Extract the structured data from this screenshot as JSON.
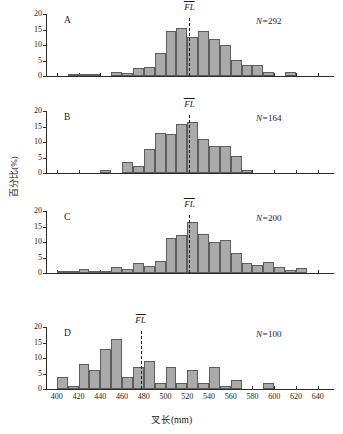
{
  "axes": {
    "ylabel": "百分比(%)",
    "xlabel": "叉长(mm)",
    "yticks": [
      "0",
      "5",
      "10",
      "15",
      "20"
    ],
    "xticks": [
      "400",
      "420",
      "440",
      "460",
      "480",
      "500",
      "520",
      "540",
      "560",
      "580",
      "600",
      "620",
      "640"
    ]
  },
  "fl_label": "FL",
  "chart_data": {
    "type": "bar",
    "title": "",
    "xlabel": "叉长(mm)",
    "ylabel": "百分比(%)",
    "xlim": [
      390,
      655
    ],
    "ylim": [
      0,
      20
    ],
    "bin_width": 10,
    "grid": false,
    "legend": "none",
    "panels": [
      {
        "letter": "A",
        "n_prefix": "N=",
        "n_value": "292",
        "mean_fl": 522,
        "bins": [
          395,
          405,
          415,
          425,
          435,
          445,
          455,
          465,
          475,
          485,
          495,
          505,
          515,
          525,
          535,
          545,
          555,
          565,
          575,
          585,
          595,
          605,
          615,
          625,
          635,
          645
        ],
        "values": [
          0,
          0,
          0.3,
          0.4,
          0.4,
          0,
          1.2,
          1.0,
          2.7,
          3.0,
          7.3,
          14.6,
          15.4,
          12.6,
          14.4,
          11.9,
          10.0,
          5.2,
          3.7,
          3.4,
          1.3,
          0,
          1.2,
          0,
          0,
          0
        ]
      },
      {
        "letter": "B",
        "n_prefix": "N=",
        "n_value": "164",
        "mean_fl": 522,
        "bins": [
          395,
          405,
          415,
          425,
          435,
          445,
          455,
          465,
          475,
          485,
          495,
          505,
          515,
          525,
          535,
          545,
          555,
          565,
          575,
          585,
          595,
          605,
          615,
          625,
          635,
          645
        ],
        "values": [
          0,
          0,
          0,
          0,
          0,
          0.9,
          0,
          3.4,
          2.3,
          7.6,
          12.8,
          12.7,
          15.7,
          16.4,
          10.9,
          8.6,
          8.6,
          5.5,
          1.0,
          0,
          0,
          0,
          0,
          0,
          0,
          0
        ]
      },
      {
        "letter": "C",
        "n_prefix": "N=",
        "n_value": "200",
        "mean_fl": 522,
        "bins": [
          395,
          405,
          415,
          425,
          435,
          445,
          455,
          465,
          475,
          485,
          495,
          505,
          515,
          525,
          535,
          545,
          555,
          565,
          575,
          585,
          595,
          605,
          615,
          625,
          635,
          645
        ],
        "values": [
          0,
          0.3,
          0.3,
          1.2,
          0.6,
          0.6,
          1.9,
          1.3,
          3.3,
          2.4,
          4.0,
          11.2,
          12.4,
          16.5,
          12.5,
          10.0,
          10.6,
          6.5,
          3.1,
          2.6,
          3.4,
          2.0,
          1.0,
          1.5,
          0,
          0
        ]
      },
      {
        "letter": "D",
        "n_prefix": "N=",
        "n_value": "100",
        "mean_fl": 477,
        "bins": [
          395,
          405,
          415,
          425,
          435,
          445,
          455,
          465,
          475,
          485,
          495,
          505,
          515,
          525,
          535,
          545,
          555,
          565,
          575,
          585,
          595,
          605,
          615,
          625,
          635,
          645
        ],
        "values": [
          0,
          4,
          1,
          8,
          6,
          13,
          16,
          4,
          7,
          9,
          2,
          7,
          2,
          6,
          2,
          7,
          1,
          3,
          0,
          0,
          2,
          0,
          0,
          0,
          0,
          0
        ]
      }
    ]
  }
}
